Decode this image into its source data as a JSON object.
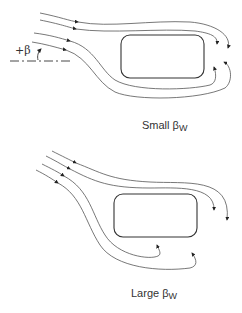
{
  "diagram": {
    "top": {
      "angle_label": "+β",
      "caption_main": "Small β",
      "caption_sub": "W"
    },
    "bottom": {
      "caption_main": "Large β",
      "caption_sub": "W"
    },
    "colors": {
      "stroke": "#444444",
      "body_outline": "#333333"
    }
  }
}
